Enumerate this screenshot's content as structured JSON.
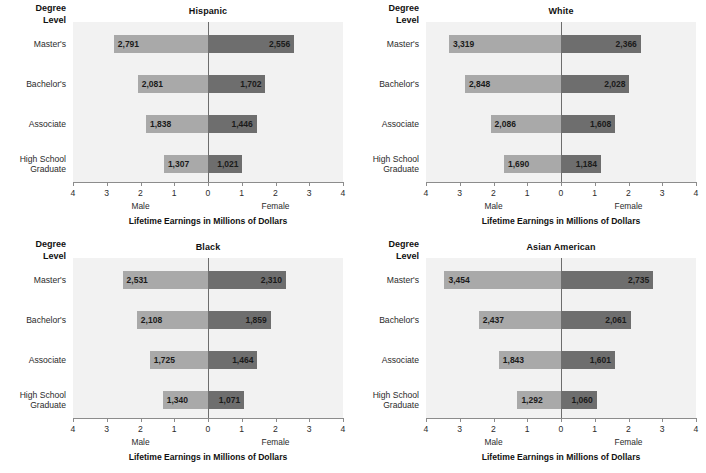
{
  "figure": {
    "corner_header": "Degree\nLevel",
    "axis_title": "Lifetime Earnings in Millions of Dollars",
    "left_side_label": "Male",
    "right_side_label": "Female",
    "tick_labels": [
      "4",
      "3",
      "2",
      "1",
      "0",
      "1",
      "2",
      "3",
      "4"
    ],
    "colors": {
      "male_bar": "#a9a9a9",
      "female_bar": "#6e6e6e",
      "plot_background": "#f2f2f2",
      "zero_line": "#6d6d6d",
      "axis": "#8c8c8c",
      "text": "#1b1b1b"
    }
  },
  "chart_data": [
    {
      "type": "bar",
      "title": "Hispanic",
      "xlabel": "Lifetime Earnings in Millions of Dollars",
      "ylabel": "Degree Level",
      "xlim": [
        -4,
        4
      ],
      "xticks": [
        4,
        3,
        2,
        1,
        0,
        1,
        2,
        3,
        4
      ],
      "grid": false,
      "legend": "none",
      "orientation": "horizontal-diverging",
      "categories": [
        "Master's",
        "Bachelor's",
        "Associate",
        "High School\nGraduate"
      ],
      "series": [
        {
          "name": "Male",
          "direction": "left",
          "values": [
            2.791,
            2.081,
            1.838,
            1.307
          ],
          "labels": [
            "2,791",
            "2,081",
            "1,838",
            "1,307"
          ]
        },
        {
          "name": "Female",
          "direction": "right",
          "values": [
            2.556,
            1.702,
            1.446,
            1.021
          ],
          "labels": [
            "2,556",
            "1,702",
            "1,446",
            "1,021"
          ]
        }
      ]
    },
    {
      "type": "bar",
      "title": "White",
      "xlabel": "Lifetime Earnings in Millions of Dollars",
      "ylabel": "Degree Level",
      "xlim": [
        -4,
        4
      ],
      "xticks": [
        4,
        3,
        2,
        1,
        0,
        1,
        2,
        3,
        4
      ],
      "grid": false,
      "legend": "none",
      "orientation": "horizontal-diverging",
      "categories": [
        "Master's",
        "Bachelor's",
        "Associate",
        "High School\nGraduate"
      ],
      "series": [
        {
          "name": "Male",
          "direction": "left",
          "values": [
            3.319,
            2.848,
            2.086,
            1.69
          ],
          "labels": [
            "3,319",
            "2,848",
            "2,086",
            "1,690"
          ]
        },
        {
          "name": "Female",
          "direction": "right",
          "values": [
            2.366,
            2.028,
            1.608,
            1.184
          ],
          "labels": [
            "2,366",
            "2,028",
            "1,608",
            "1,184"
          ]
        }
      ]
    },
    {
      "type": "bar",
      "title": "Black",
      "xlabel": "Lifetime Earnings in Millions of Dollars",
      "ylabel": "Degree Level",
      "xlim": [
        -4,
        4
      ],
      "xticks": [
        4,
        3,
        2,
        1,
        0,
        1,
        2,
        3,
        4
      ],
      "grid": false,
      "legend": "none",
      "orientation": "horizontal-diverging",
      "categories": [
        "Master's",
        "Bachelor's",
        "Associate",
        "High School\nGraduate"
      ],
      "series": [
        {
          "name": "Male",
          "direction": "left",
          "values": [
            2.531,
            2.108,
            1.725,
            1.34
          ],
          "labels": [
            "2,531",
            "2,108",
            "1,725",
            "1,340"
          ]
        },
        {
          "name": "Female",
          "direction": "right",
          "values": [
            2.31,
            1.859,
            1.464,
            1.071
          ],
          "labels": [
            "2,310",
            "1,859",
            "1,464",
            "1,071"
          ]
        }
      ]
    },
    {
      "type": "bar",
      "title": "Asian American",
      "xlabel": "Lifetime Earnings in Millions of Dollars",
      "ylabel": "Degree Level",
      "xlim": [
        -4,
        4
      ],
      "xticks": [
        4,
        3,
        2,
        1,
        0,
        1,
        2,
        3,
        4
      ],
      "grid": false,
      "legend": "none",
      "orientation": "horizontal-diverging",
      "categories": [
        "Master's",
        "Bachelor's",
        "Associate",
        "High School\nGraduate"
      ],
      "series": [
        {
          "name": "Male",
          "direction": "left",
          "values": [
            3.454,
            2.437,
            1.843,
            1.292
          ],
          "labels": [
            "3,454",
            "2,437",
            "1,843",
            "1,292"
          ]
        },
        {
          "name": "Female",
          "direction": "right",
          "values": [
            2.735,
            2.061,
            1.601,
            1.06
          ],
          "labels": [
            "2,735",
            "2,061",
            "1,601",
            "1,060"
          ]
        }
      ]
    }
  ]
}
